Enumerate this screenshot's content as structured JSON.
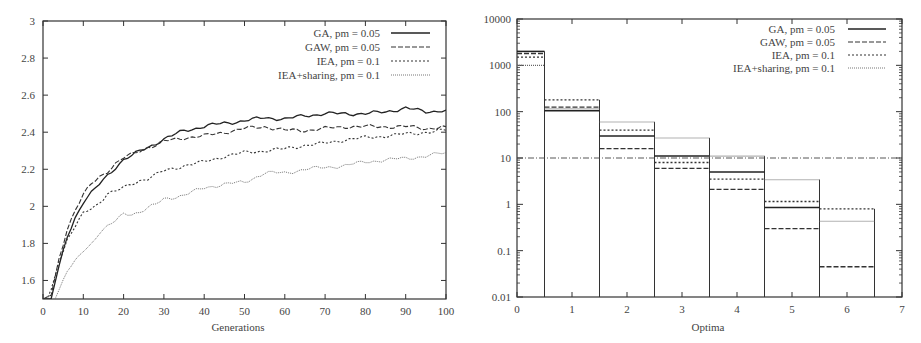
{
  "chart_data": [
    {
      "type": "line",
      "title": "",
      "xlabel": "Generations",
      "ylabel": "",
      "xlim": [
        0,
        100
      ],
      "ylim": [
        1.5,
        3
      ],
      "x_ticks": [
        "0",
        "10",
        "20",
        "30",
        "40",
        "50",
        "60",
        "70",
        "80",
        "90",
        "100"
      ],
      "y_ticks": [
        "1.6",
        "1.8",
        "2",
        "2.2",
        "2.4",
        "2.6",
        "2.8",
        "3"
      ],
      "grid": false,
      "legend_position": "top-right",
      "x": [
        0,
        2,
        4,
        6,
        8,
        10,
        12,
        14,
        16,
        18,
        20,
        22,
        24,
        26,
        28,
        30,
        35,
        40,
        45,
        50,
        55,
        60,
        65,
        70,
        75,
        80,
        85,
        90,
        95,
        100
      ],
      "series": [
        {
          "name": "GA, pm = 0.05",
          "style": "solid",
          "values": [
            1.5,
            1.5,
            1.68,
            1.84,
            1.94,
            2.02,
            2.07,
            2.12,
            2.17,
            2.21,
            2.25,
            2.27,
            2.3,
            2.32,
            2.34,
            2.36,
            2.41,
            2.43,
            2.45,
            2.46,
            2.48,
            2.47,
            2.49,
            2.5,
            2.5,
            2.5,
            2.51,
            2.53,
            2.51,
            2.52
          ]
        },
        {
          "name": "GAW, pm = 0.05",
          "style": "dashed",
          "values": [
            1.5,
            1.52,
            1.72,
            1.88,
            1.98,
            2.06,
            2.12,
            2.16,
            2.19,
            2.23,
            2.26,
            2.28,
            2.3,
            2.32,
            2.33,
            2.35,
            2.37,
            2.38,
            2.4,
            2.42,
            2.43,
            2.41,
            2.41,
            2.42,
            2.43,
            2.43,
            2.43,
            2.43,
            2.42,
            2.43
          ]
        },
        {
          "name": "IEA, pm = 0.1",
          "style": "dotted-short",
          "values": [
            1.45,
            1.55,
            1.7,
            1.82,
            1.89,
            1.96,
            1.99,
            2.02,
            2.07,
            2.08,
            2.1,
            2.12,
            2.14,
            2.15,
            2.17,
            2.19,
            2.22,
            2.24,
            2.27,
            2.29,
            2.3,
            2.31,
            2.33,
            2.34,
            2.36,
            2.37,
            2.38,
            2.39,
            2.4,
            2.41
          ]
        },
        {
          "name": "IEA+sharing, pm = 0.1",
          "style": "dotted-fine",
          "values": [
            1.4,
            1.45,
            1.55,
            1.65,
            1.7,
            1.76,
            1.8,
            1.86,
            1.89,
            1.92,
            1.96,
            1.96,
            1.97,
            1.99,
            2.01,
            2.04,
            2.06,
            2.1,
            2.12,
            2.13,
            2.18,
            2.18,
            2.2,
            2.21,
            2.22,
            2.24,
            2.25,
            2.26,
            2.27,
            2.29
          ]
        }
      ]
    },
    {
      "type": "bar",
      "title": "",
      "xlabel": "Optima",
      "ylabel": "",
      "yscale": "log",
      "xlim": [
        0,
        7
      ],
      "ylim": [
        0.01,
        10000
      ],
      "x_ticks": [
        "0",
        "1",
        "2",
        "3",
        "4",
        "5",
        "6",
        "7"
      ],
      "y_ticks": [
        "0.01",
        "0.1",
        "1",
        "10",
        "100",
        "1000",
        "10000"
      ],
      "grid": false,
      "legend_position": "top-right",
      "reference_line": {
        "y": 10,
        "style": "dash-dot"
      },
      "categories": [
        "0",
        "1",
        "2",
        "3",
        "4",
        "5",
        "6"
      ],
      "series": [
        {
          "name": "GA, pm = 0.05",
          "style": "solid",
          "values": [
            2000,
            105,
            30,
            11,
            5,
            0.85,
            null
          ]
        },
        {
          "name": "GAW, pm = 0.05",
          "style": "dashed",
          "values": [
            1800,
            125,
            16,
            6,
            2.1,
            0.3,
            0.045
          ]
        },
        {
          "name": "IEA, pm = 0.1",
          "style": "dotted-short",
          "values": [
            1500,
            180,
            40,
            8,
            3.5,
            1.15,
            0.8
          ]
        },
        {
          "name": "IEA+sharing, pm = 0.1",
          "style": "dotted-fine",
          "values": [
            1000,
            115,
            60,
            27,
            11,
            3.4,
            0.43
          ]
        }
      ]
    }
  ],
  "left_chart": {
    "xlabel": "Generations",
    "x_ticks": [
      "0",
      "10",
      "20",
      "30",
      "40",
      "50",
      "60",
      "70",
      "80",
      "90",
      "100"
    ],
    "y_ticks": [
      "1.6",
      "1.8",
      "2",
      "2.2",
      "2.4",
      "2.6",
      "2.8",
      "3"
    ],
    "legend": [
      "GA, pm = 0.05",
      "GAW, pm = 0.05",
      "IEA, pm = 0.1",
      "IEA+sharing, pm = 0.1"
    ]
  },
  "right_chart": {
    "xlabel": "Optima",
    "x_ticks": [
      "0",
      "1",
      "2",
      "3",
      "4",
      "5",
      "6",
      "7"
    ],
    "y_ticks": [
      "0.01",
      "0.1",
      "1",
      "10",
      "100",
      "1000",
      "10000"
    ],
    "legend": [
      "GA, pm = 0.05",
      "GAW, pm = 0.05",
      "IEA, pm = 0.1",
      "IEA+sharing, pm = 0.1"
    ]
  }
}
